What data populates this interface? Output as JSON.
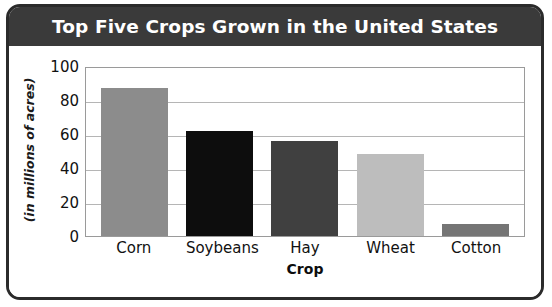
{
  "chart_data": {
    "type": "bar",
    "title": "Top Five Crops Grown in the United States",
    "xlabel": "Crop",
    "ylabel": "(in millions of acres)",
    "categories": [
      "Corn",
      "Soybeans",
      "Hay",
      "Wheat",
      "Cotton"
    ],
    "values": [
      87,
      62,
      56,
      48,
      7
    ],
    "bar_colors": [
      "#8c8c8c",
      "#0d0d0d",
      "#404040",
      "#bdbdbd",
      "#757575"
    ],
    "ylim": [
      0,
      100
    ],
    "yticks": [
      0,
      20,
      40,
      60,
      80,
      100
    ],
    "ytick_labels": [
      "0",
      "20",
      "40",
      "60",
      "80",
      "100"
    ],
    "grid": true,
    "legend": "none"
  },
  "style": {
    "title_bar_color": "#3a3a3a",
    "title_text_color": "#ffffff",
    "frame_color": "#2b2b2b",
    "grid_color": "#b5b5b5",
    "plot_background": "#ffffff"
  }
}
